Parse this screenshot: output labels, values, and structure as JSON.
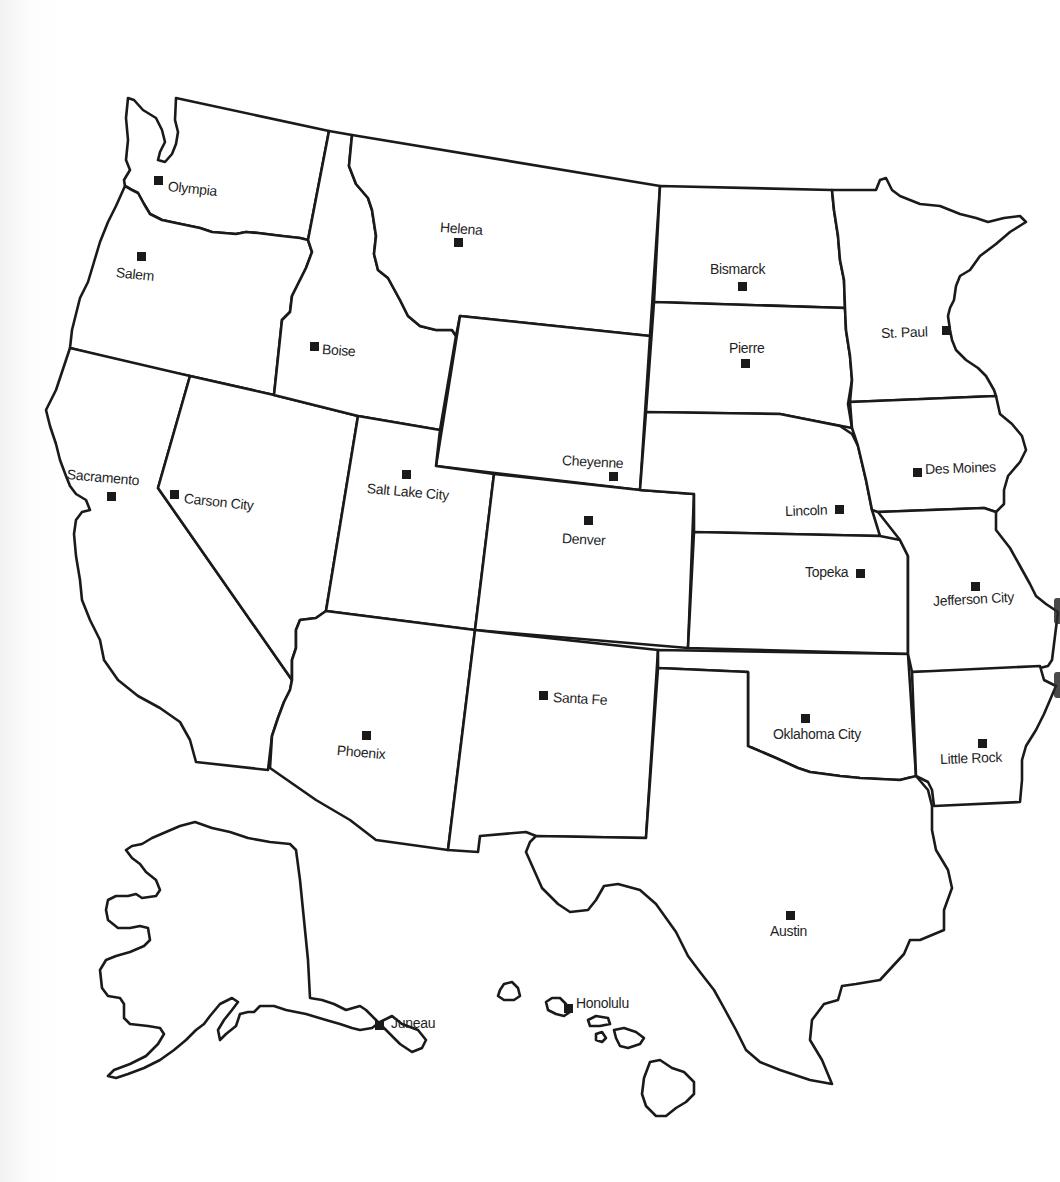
{
  "map": {
    "title": "Western United States – State Capitals",
    "capitals": [
      {
        "name": "Olympia",
        "state": "Washington",
        "x": 154,
        "y": 176,
        "lx": 168,
        "ly": 178,
        "rot": 6
      },
      {
        "name": "Salem",
        "state": "Oregon",
        "x": 137,
        "y": 252,
        "lx": 116,
        "ly": 264,
        "rot": 6
      },
      {
        "name": "Boise",
        "state": "Idaho",
        "x": 310,
        "y": 342,
        "lx": 322,
        "ly": 342,
        "rot": 4
      },
      {
        "name": "Helena",
        "state": "Montana",
        "x": 454,
        "y": 238,
        "lx": 440,
        "ly": 219,
        "rot": 4
      },
      {
        "name": "Bismarck",
        "state": "North Dakota",
        "x": 738,
        "y": 282,
        "lx": 710,
        "ly": 261,
        "rot": 0
      },
      {
        "name": "Pierre",
        "state": "South Dakota",
        "x": 741,
        "y": 359,
        "lx": 729,
        "ly": 340,
        "rot": 0
      },
      {
        "name": "St. Paul",
        "state": "Minnesota",
        "x": 942,
        "y": 326,
        "lx": 881,
        "ly": 326,
        "rot": -2
      },
      {
        "name": "Sacramento",
        "state": "California",
        "x": 107,
        "y": 492,
        "lx": 67,
        "ly": 472,
        "rot": 5
      },
      {
        "name": "Carson City",
        "state": "Nevada",
        "x": 170,
        "y": 490,
        "lx": 184,
        "ly": 494,
        "rot": 6
      },
      {
        "name": "Salt Lake City",
        "state": "Utah",
        "x": 402,
        "y": 470,
        "lx": 367,
        "ly": 484,
        "rot": 5
      },
      {
        "name": "Cheyenne",
        "state": "Wyoming",
        "x": 609,
        "y": 472,
        "lx": 562,
        "ly": 453,
        "rot": 3
      },
      {
        "name": "Denver",
        "state": "Colorado",
        "x": 584,
        "y": 516,
        "lx": 562,
        "ly": 530,
        "rot": 3
      },
      {
        "name": "Lincoln",
        "state": "Nebraska",
        "x": 835,
        "y": 505,
        "lx": 785,
        "ly": 503,
        "rot": -2
      },
      {
        "name": "Topeka",
        "state": "Kansas",
        "x": 856,
        "y": 569,
        "lx": 805,
        "ly": 565,
        "rot": 0
      },
      {
        "name": "Des Moines",
        "state": "Iowa",
        "x": 913,
        "y": 468,
        "lx": 925,
        "ly": 462,
        "rot": -2
      },
      {
        "name": "Jefferson City",
        "state": "Missouri",
        "x": 971,
        "y": 582,
        "lx": 933,
        "ly": 593,
        "rot": -3
      },
      {
        "name": "Phoenix",
        "state": "Arizona",
        "x": 362,
        "y": 731,
        "lx": 337,
        "ly": 744,
        "rot": 5
      },
      {
        "name": "Santa Fe",
        "state": "New Mexico",
        "x": 539,
        "y": 691,
        "lx": 553,
        "ly": 690,
        "rot": 3
      },
      {
        "name": "Oklahoma City",
        "state": "Oklahoma",
        "x": 801,
        "y": 714,
        "lx": 773,
        "ly": 727,
        "rot": 0
      },
      {
        "name": "Little Rock",
        "state": "Arkansas",
        "x": 978,
        "y": 739,
        "lx": 940,
        "ly": 752,
        "rot": -2
      },
      {
        "name": "Austin",
        "state": "Texas",
        "x": 786,
        "y": 911,
        "lx": 770,
        "ly": 924,
        "rot": 0
      },
      {
        "name": "Juneau",
        "state": "Alaska",
        "x": 375,
        "y": 1021,
        "lx": 391,
        "ly": 1016,
        "rot": 0
      },
      {
        "name": "Honolulu",
        "state": "Hawaii",
        "x": 564,
        "y": 1004,
        "lx": 576,
        "ly": 996,
        "rot": 0
      }
    ],
    "colors": {
      "outline": "#1a1a1a",
      "fill": "#ffffff",
      "marker": "#1a1a1a",
      "label": "#1f1f1f"
    }
  }
}
